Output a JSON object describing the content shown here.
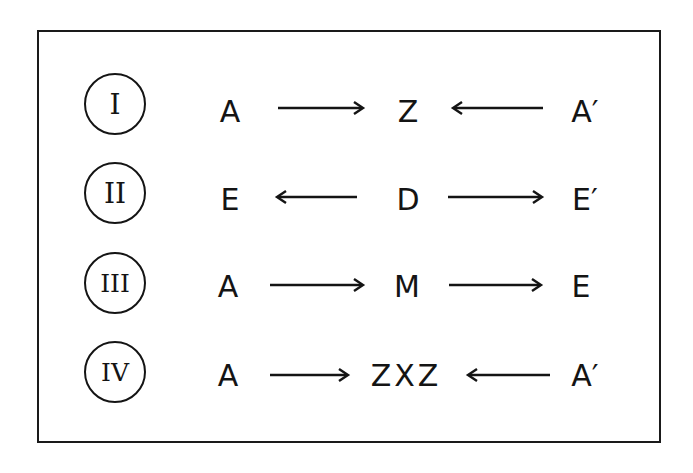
{
  "diagram": {
    "rows": [
      {
        "numeral": "I",
        "left": "A",
        "center": "Z",
        "right": "A′",
        "arrow_left": "right",
        "arrow_right": "left"
      },
      {
        "numeral": "II",
        "left": "E",
        "center": "D",
        "right": "E′",
        "arrow_left": "left",
        "arrow_right": "right"
      },
      {
        "numeral": "III",
        "left": "A",
        "center": "M",
        "right": "E",
        "arrow_left": "right",
        "arrow_right": "right"
      },
      {
        "numeral": "IV",
        "left": "A",
        "center": "ZXZ",
        "right": "A′",
        "arrow_left": "right",
        "arrow_right": "left"
      }
    ]
  }
}
